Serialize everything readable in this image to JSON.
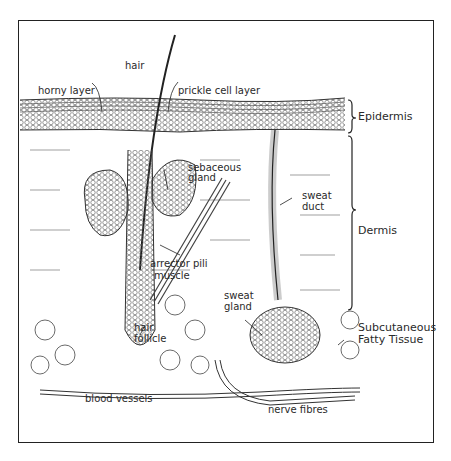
{
  "diagram": {
    "labels": {
      "hair": "hair",
      "horny_layer": "horny layer",
      "prickle_cell_layer": "prickle cell layer",
      "sebaceous_gland_1": "sebaceous",
      "sebaceous_gland_2": "gland",
      "sweat_duct_1": "sweat",
      "sweat_duct_2": "duct",
      "arrector_pili_1": "arrector pili",
      "arrector_pili_2": "muscle",
      "sweat_gland_1": "sweat",
      "sweat_gland_2": "gland",
      "hair_follicle_1": "hair",
      "hair_follicle_2": "follicle",
      "blood_vessels": "blood vessels",
      "nerve_fibres": "nerve fibres"
    },
    "layers": {
      "epidermis": "Epidermis",
      "dermis": "Dermis",
      "subcutaneous_1": "Subcutaneous",
      "subcutaneous_2": "Fatty Tissue"
    }
  }
}
